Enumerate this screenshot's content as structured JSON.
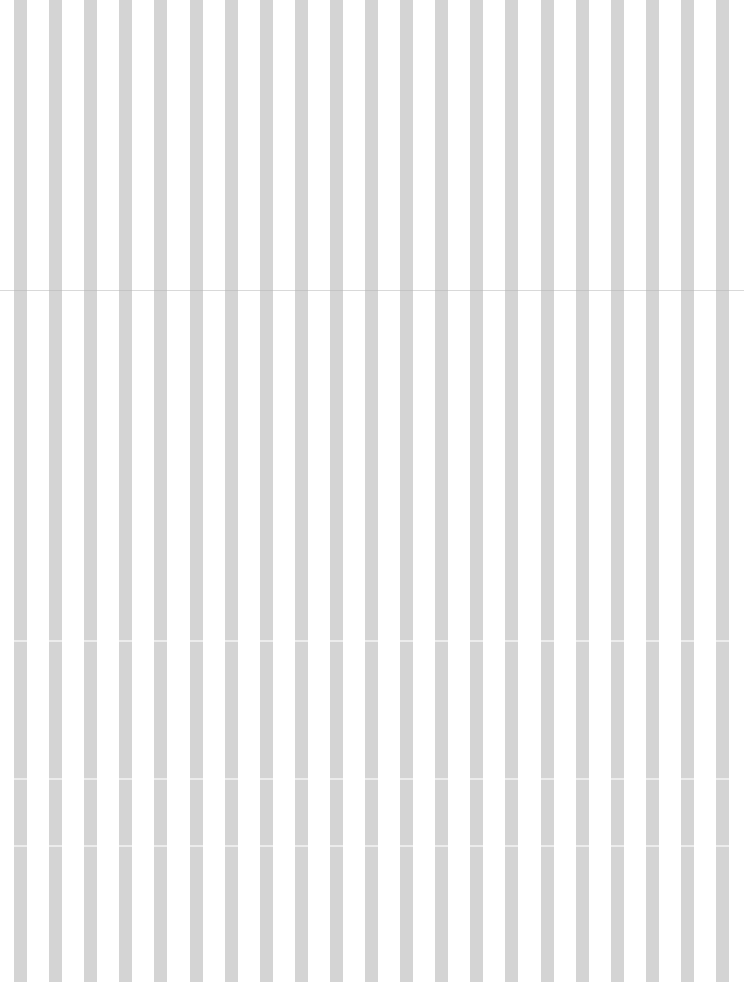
{
  "pattern": {
    "type": "vertical-stripes",
    "stripe_color": "#d4d4d4",
    "background_color": "#ffffff",
    "stripe_count": 21,
    "first_stripe_x": 14,
    "stripe_width": 13,
    "period": 35.1,
    "seams_y": [
      290,
      640,
      778,
      845
    ]
  }
}
